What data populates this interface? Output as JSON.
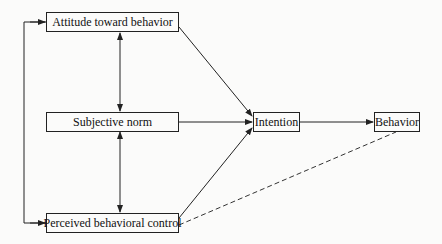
{
  "diagram": {
    "type": "flowchart",
    "nodes": [
      {
        "id": "attitude",
        "label": "Attitude toward behavior"
      },
      {
        "id": "norm",
        "label": "Subjective norm"
      },
      {
        "id": "control",
        "label": "Perceived behavioral control"
      },
      {
        "id": "intention",
        "label": "Intention"
      },
      {
        "id": "behavior",
        "label": "Behavior"
      }
    ],
    "edges": [
      {
        "from": "attitude",
        "to": "intention",
        "style": "solid"
      },
      {
        "from": "norm",
        "to": "intention",
        "style": "solid"
      },
      {
        "from": "control",
        "to": "intention",
        "style": "solid"
      },
      {
        "from": "intention",
        "to": "behavior",
        "style": "solid"
      },
      {
        "from": "control",
        "to": "behavior",
        "style": "dashed"
      },
      {
        "from": "attitude",
        "to": "norm",
        "style": "solid",
        "bidirectional": true
      },
      {
        "from": "norm",
        "to": "control",
        "style": "solid",
        "bidirectional": true
      },
      {
        "from": "attitude",
        "to": "control",
        "style": "solid",
        "bidirectional": true,
        "route": "left-bracket"
      }
    ],
    "colors": {
      "line": "#222222",
      "background": "#fbfbfa"
    }
  }
}
